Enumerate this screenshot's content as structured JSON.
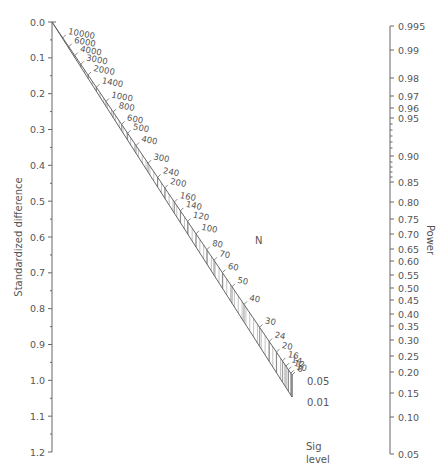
{
  "chart_data": {
    "type": "nomogram",
    "title": "",
    "left_axis": {
      "label": "Standardized difference",
      "ticks": [
        "0.0",
        "0.1",
        "0.2",
        "0.3",
        "0.4",
        "0.5",
        "0.6",
        "0.7",
        "0.8",
        "0.9",
        "1.0",
        "1.1",
        "1.2"
      ],
      "range": [
        0.0,
        1.2
      ]
    },
    "right_axis": {
      "label": "Power",
      "ticks": [
        {
          "label": "0.995",
          "y": 26
        },
        {
          "label": "0.99",
          "y": 50
        },
        {
          "label": "0.98",
          "y": 78
        },
        {
          "label": "0.97",
          "y": 96
        },
        {
          "label": "0.96",
          "y": 108
        },
        {
          "label": "0.95",
          "y": 118
        },
        {
          "label": "0.90",
          "y": 156
        },
        {
          "label": "0.85",
          "y": 182
        },
        {
          "label": "0.80",
          "y": 202
        },
        {
          "label": "0.75",
          "y": 219
        },
        {
          "label": "0.70",
          "y": 234
        },
        {
          "label": "0.65",
          "y": 249
        },
        {
          "label": "0.60",
          "y": 261
        },
        {
          "label": "0.55",
          "y": 275
        },
        {
          "label": "0.50",
          "y": 288
        },
        {
          "label": "0.45",
          "y": 300
        },
        {
          "label": "0.40",
          "y": 314
        },
        {
          "label": "0.35",
          "y": 326
        },
        {
          "label": "0.30",
          "y": 340
        },
        {
          "label": "0.25",
          "y": 356
        },
        {
          "label": "0.20",
          "y": 372
        },
        {
          "label": "0.15",
          "y": 393
        },
        {
          "label": "0.10",
          "y": 417
        },
        {
          "label": "0.05",
          "y": 454
        }
      ]
    },
    "n_scale": {
      "label": "N",
      "values": [
        "10000",
        "6000",
        "4000",
        "3000",
        "2000",
        "1400",
        "1000",
        "800",
        "600",
        "500",
        "400",
        "300",
        "240",
        "200",
        "160",
        "140",
        "120",
        "100",
        "80",
        "70",
        "60",
        "50",
        "40",
        "30",
        "24",
        "20",
        "16",
        "14",
        "12",
        "10",
        "8"
      ],
      "t": [
        0.045,
        0.07,
        0.095,
        0.12,
        0.15,
        0.185,
        0.225,
        0.255,
        0.29,
        0.315,
        0.35,
        0.4,
        0.44,
        0.47,
        0.51,
        0.535,
        0.565,
        0.6,
        0.645,
        0.675,
        0.71,
        0.75,
        0.8,
        0.865,
        0.905,
        0.935,
        0.96,
        0.975,
        0.985,
        0.995,
        1.0
      ]
    },
    "sig_level": {
      "label_line1": "Sig",
      "label_line2": "level",
      "values": [
        "0.05",
        "0.01"
      ]
    }
  }
}
